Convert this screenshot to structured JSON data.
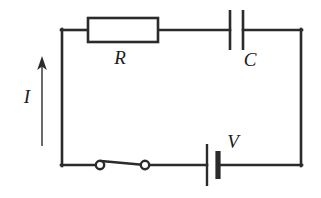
{
  "figure": {
    "background_color": "#ffffff",
    "line_color": "#2b2b2b",
    "width": 321,
    "height": 198
  },
  "labels": {
    "resistor": "R",
    "capacitor": "C",
    "voltage_source": "V",
    "current": "I"
  },
  "components": [
    {
      "name": "resistor",
      "symbol": "rectangle-box",
      "label": "R",
      "label_position": "below",
      "branch": "top"
    },
    {
      "name": "capacitor",
      "symbol": "parallel-plates",
      "label": "C",
      "label_position": "below-right",
      "branch": "top"
    },
    {
      "name": "battery",
      "symbol": "cell-long-short-plate",
      "label": "V",
      "label_position": "above-right",
      "branch": "bottom"
    },
    {
      "name": "switch",
      "symbol": "open-switch-two-nodes",
      "label": "",
      "state": "closed",
      "branch": "bottom"
    },
    {
      "name": "current-arrow",
      "symbol": "arrow-up",
      "label": "I",
      "direction": "up",
      "branch": "left"
    }
  ]
}
